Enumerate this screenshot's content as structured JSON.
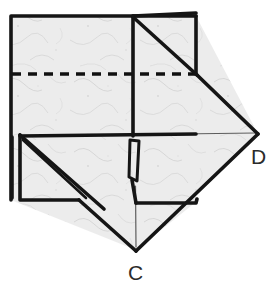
{
  "figure": {
    "labels": [
      {
        "id": "D",
        "text": "D",
        "x": 258,
        "y": 134,
        "label_x": 251,
        "label_y": 146
      },
      {
        "id": "C",
        "text": "C",
        "x": 136,
        "y": 250,
        "label_x": 128,
        "label_y": 262
      }
    ],
    "colors": {
      "paper_fill": "#e9e9e9",
      "paper_fill_light": "#efefef",
      "outline": "#151515",
      "thin_line": "#5d5d5d",
      "crease_dashed": "#111111",
      "background": "#ffffff",
      "label_text": "#2b2b2b"
    },
    "geometry": {
      "outline_width": 3.6,
      "thin_line_width": 1.2,
      "dash_pattern": "9 7",
      "dash_width": 3.4,
      "top_left_sheet": [
        [
          11,
          16
        ],
        [
          196,
          16
        ],
        [
          196,
          135
        ],
        [
          11,
          135
        ]
      ],
      "lower_left_sheet": [
        [
          11,
          135
        ],
        [
          136,
          135
        ],
        [
          136,
          250
        ],
        [
          11,
          200
        ]
      ],
      "right_diamond": [
        [
          196,
          16
        ],
        [
          258,
          134
        ],
        [
          136,
          250
        ],
        [
          136,
          16
        ]
      ],
      "top_right_square": [
        [
          133,
          16
        ],
        [
          196,
          16
        ],
        [
          196,
          74
        ],
        [
          133,
          74
        ]
      ],
      "top_right_diagonal": [
        [
          133,
          16
        ],
        [
          196,
          74
        ]
      ],
      "dashed_crease": [
        [
          11,
          74
        ],
        [
          196,
          74
        ]
      ],
      "center_vertical": [
        [
          133,
          16
        ],
        [
          133,
          250
        ]
      ],
      "horizontal_mid_left": [
        [
          20,
          136
        ],
        [
          196,
          134
        ]
      ],
      "thin_horizontal_right": [
        [
          140,
          134
        ],
        [
          256,
          133
        ]
      ],
      "bottom_left_flap": [
        [
          20,
          135
        ],
        [
          20,
          200
        ],
        [
          78,
          200
        ]
      ],
      "bottom_left_flap_diagonal": [
        [
          20,
          135
        ],
        [
          100,
          205
        ]
      ],
      "center_sliver": [
        [
          131,
          140
        ],
        [
          139,
          140
        ],
        [
          137,
          180
        ],
        [
          129,
          176
        ]
      ],
      "lower_right_step": [
        [
          136,
          200
        ],
        [
          196,
          200
        ],
        [
          196,
          204
        ]
      ]
    }
  }
}
